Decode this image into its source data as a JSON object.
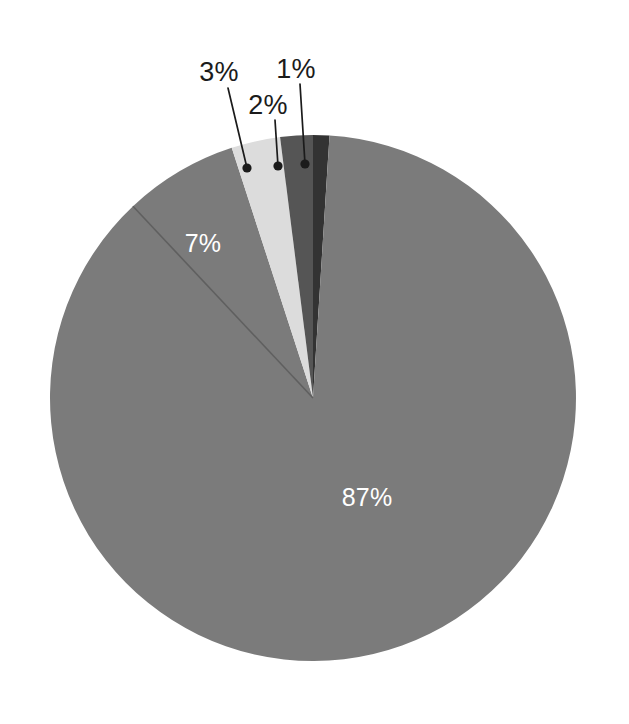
{
  "chart_data": {
    "type": "pie",
    "title": "",
    "subtitle": "",
    "xlabel": "",
    "ylabel": "",
    "legend": "none",
    "grid": false,
    "units": "percent",
    "start_angle_deg": 0,
    "direction": "clockwise",
    "categories": [
      "87%",
      "7%",
      "3%",
      "2%",
      "1%"
    ],
    "values": [
      87,
      7,
      3,
      2,
      1
    ],
    "slices": [
      {
        "id": "slice-1",
        "label": "1%",
        "value": 1,
        "color": "#333333",
        "label_color": "#1b1b1b",
        "label_position": "outside",
        "label_x": 296,
        "label_y": 71,
        "leader_from_x": 300,
        "leader_from_y": 84,
        "leader_to_x": 305,
        "leader_to_y": 164
      },
      {
        "id": "slice-87",
        "label": "87%",
        "value": 87,
        "color": "#7b7b7b",
        "label_color": "#ffffff",
        "label_position": "inside",
        "label_x": 367,
        "label_y": 499
      },
      {
        "id": "slice-7",
        "label": "7%",
        "value": 7,
        "color": "#7b7b7b",
        "label_color": "#ffffff",
        "label_position": "inside",
        "label_x": 203,
        "label_y": 245
      },
      {
        "id": "slice-3",
        "label": "3%",
        "value": 3,
        "color": "#dcdcdc",
        "label_color": "#1b1b1b",
        "label_position": "outside",
        "label_x": 219,
        "label_y": 74,
        "leader_from_x": 228,
        "leader_from_y": 88,
        "leader_to_x": 247,
        "leader_to_y": 168
      },
      {
        "id": "slice-2",
        "label": "2%",
        "value": 2,
        "color": "#555555",
        "label_color": "#1b1b1b",
        "label_position": "outside",
        "label_x": 268,
        "label_y": 107,
        "leader_from_x": 275,
        "leader_from_y": 120,
        "leader_to_x": 278,
        "leader_to_y": 166
      }
    ],
    "geometry": {
      "center_x": 313,
      "center_y": 398,
      "radius": 263,
      "canvas_width": 629,
      "canvas_height": 724,
      "background": "#ffffff"
    },
    "separator": {
      "color": "#5f5f5f",
      "between": [
        "87%",
        "7%"
      ]
    }
  }
}
